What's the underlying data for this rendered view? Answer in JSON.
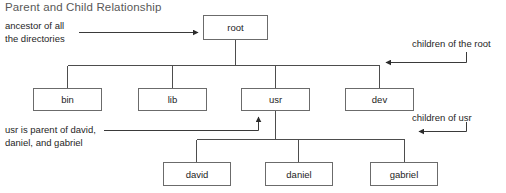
{
  "diagram": {
    "title": "Parent and Child Relationship",
    "nodes": {
      "root": "root",
      "bin": "bin",
      "lib": "lib",
      "usr": "usr",
      "dev": "dev",
      "david": "david",
      "daniel": "daniel",
      "gabriel": "gabriel"
    },
    "annotations": {
      "ancestor_line1": "ancestor of all",
      "ancestor_line2": "the directories",
      "children_of_root": "children of the root",
      "children_of_usr": "children of usr",
      "usr_parent_line1": "usr is parent of david,",
      "usr_parent_line2": "daniel, and gabriel"
    },
    "colors": {
      "background": "#ffffff",
      "box_border": "#6b6b6b",
      "line": "#4d4d4d",
      "title_text": "#585858",
      "body_text": "#262626"
    }
  }
}
